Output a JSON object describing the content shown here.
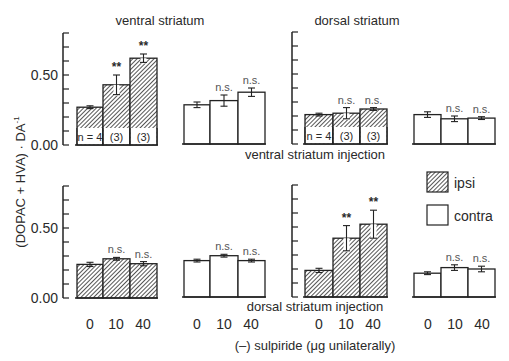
{
  "chart_data": {
    "type": "bar",
    "title": "",
    "ylabel": "(DOPAC + HVA) · DA⁻¹",
    "xlabel": "(–) sulpiride (μg unilaterally)",
    "ylim": [
      0,
      0.8
    ],
    "yticks": [
      0.0,
      0.1,
      0.2,
      0.3,
      0.4,
      0.5,
      0.6,
      0.7,
      0.8
    ],
    "ytick_labels": {
      "0.00": "0.00",
      "0.50": "0.50"
    },
    "categories": [
      "0",
      "10",
      "40"
    ],
    "column_titles": [
      "ventral striatum",
      "dorsal striatum"
    ],
    "row_titles": [
      "ventral striatum injection",
      "dorsal striatum injection"
    ],
    "legend": [
      {
        "name": "ipsi",
        "fill": "hatched"
      },
      {
        "name": "contra",
        "fill": "white"
      }
    ],
    "grid": false,
    "panels": [
      {
        "row": "ventral striatum injection",
        "region": "ventral striatum",
        "side": "ipsi",
        "values": [
          0.27,
          0.43,
          0.62
        ],
        "errors": [
          0.01,
          0.07,
          0.03
        ],
        "annotations": [
          "",
          "**",
          "**"
        ],
        "n_labels": [
          "n = 4",
          "(3)",
          "(3)"
        ]
      },
      {
        "row": "ventral striatum injection",
        "region": "ventral striatum",
        "side": "contra",
        "values": [
          0.28,
          0.31,
          0.37
        ],
        "errors": [
          0.02,
          0.04,
          0.03
        ],
        "annotations": [
          "",
          "n.s.",
          "n.s."
        ],
        "n_labels": []
      },
      {
        "row": "ventral striatum injection",
        "region": "dorsal striatum",
        "side": "ipsi",
        "values": [
          0.21,
          0.22,
          0.25
        ],
        "errors": [
          0.01,
          0.04,
          0.01
        ],
        "annotations": [
          "",
          "n.s.",
          "n.s."
        ],
        "n_labels": [
          "n = 4",
          "(3)",
          "(3)"
        ]
      },
      {
        "row": "ventral striatum injection",
        "region": "dorsal striatum",
        "side": "contra",
        "values": [
          0.21,
          0.18,
          0.185
        ],
        "errors": [
          0.02,
          0.02,
          0.01
        ],
        "annotations": [
          "",
          "n.s.",
          "n.s."
        ],
        "n_labels": []
      },
      {
        "row": "dorsal striatum injection",
        "region": "ventral striatum",
        "side": "ipsi",
        "values": [
          0.24,
          0.28,
          0.245
        ],
        "errors": [
          0.015,
          0.01,
          0.015
        ],
        "annotations": [
          "",
          "n.s.",
          "n.s."
        ],
        "n_labels": []
      },
      {
        "row": "dorsal striatum injection",
        "region": "ventral striatum",
        "side": "contra",
        "values": [
          0.26,
          0.295,
          0.26
        ],
        "errors": [
          0.01,
          0.01,
          0.01
        ],
        "annotations": [
          "",
          "n.s.",
          "n.s."
        ],
        "n_labels": []
      },
      {
        "row": "dorsal striatum injection",
        "region": "dorsal striatum",
        "side": "ipsi",
        "values": [
          0.19,
          0.42,
          0.52
        ],
        "errors": [
          0.015,
          0.09,
          0.1
        ],
        "annotations": [
          "",
          "**",
          "**"
        ],
        "n_labels": []
      },
      {
        "row": "dorsal striatum injection",
        "region": "dorsal striatum",
        "side": "contra",
        "values": [
          0.17,
          0.21,
          0.2
        ],
        "errors": [
          0.01,
          0.02,
          0.02
        ],
        "annotations": [
          "",
          "n.s.",
          "n.s."
        ],
        "n_labels": []
      }
    ]
  },
  "labels": {
    "col_ventral": "ventral striatum",
    "col_dorsal": "dorsal striatum",
    "row_ventral_injection": "ventral striatum injection",
    "row_dorsal_injection": "dorsal striatum injection",
    "ylabel": "(DOPAC + HVA) · DA",
    "ylabel_sup": "-1",
    "xlabel": "(–) sulpiride (μg unilaterally)",
    "legend_ipsi": "ipsi",
    "legend_contra": "contra",
    "tick_000": "0.00",
    "tick_050": "0.50"
  },
  "colors": {
    "axis": "#222222",
    "hatch": "#2b2b2b",
    "text": "#2a2a2a",
    "annot": "#555555"
  }
}
